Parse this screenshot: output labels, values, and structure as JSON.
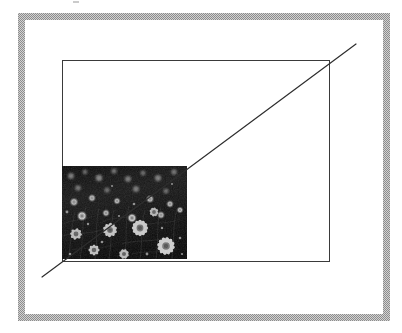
{
  "document": {
    "title": "Proportional image scaling diagram",
    "description": "A bitmap photograph placed at the lower-left of an empty outline rectangle, with a diagonal line drawn from the photo's lower-left corner through its upper-right corner and continuing to the outline rectangle's upper-right corner, illustrating constant aspect-ratio enlargement.",
    "background_color": "#ffffff"
  },
  "mat": {
    "name": "gray halftone border mat",
    "fill_color": "#a9a9a9",
    "dither_light": "#d2d2d2",
    "dither_dark": "#8d8d8d",
    "outer": {
      "x": 18,
      "y": 13,
      "width": 372,
      "height": 308
    },
    "thickness_px": 7,
    "inner_fill": "#ffffff"
  },
  "outline_rect": {
    "name": "target frame outline",
    "stroke_color": "#3a3a3a",
    "stroke_width": 1,
    "fill": "none",
    "x": 62,
    "y": 60,
    "width": 268,
    "height": 202,
    "corners": {
      "top_left": [
        62,
        60
      ],
      "top_right": [
        330,
        60
      ],
      "bottom_right": [
        330,
        262
      ],
      "bottom_left": [
        62,
        262
      ]
    }
  },
  "photo": {
    "name": "daisy field photograph",
    "subject": "black and white photograph of a meadow of daisy / chamomile flowers",
    "rendering": "grayscale halftone bitmap",
    "x": 62,
    "y": 166,
    "width": 125,
    "height": 93,
    "corners": {
      "top_left": [
        62,
        166
      ],
      "top_right": [
        187,
        166
      ],
      "bottom_right": [
        187,
        259
      ],
      "bottom_left": [
        62,
        259
      ]
    },
    "background_color": "#101010",
    "highlight_color": "#f2f2f2",
    "midtone_color": "#6e6e6e",
    "aspect_ratio": "125:93"
  },
  "diagonal": {
    "name": "aspect ratio guide line",
    "stroke_color": "#2e2e2e",
    "stroke_width": 1.2,
    "start": [
      42,
      277
    ],
    "end": [
      356,
      44
    ],
    "passes_through": [
      {
        "label": "photo bottom-left corner",
        "point": [
          62,
          259
        ]
      },
      {
        "label": "photo top-right corner",
        "point": [
          187,
          166
        ]
      },
      {
        "label": "outline rect top-right corner",
        "point": [
          330,
          60
        ]
      }
    ]
  },
  "artifact": {
    "name": "scan speck",
    "x": 73,
    "y": 1,
    "width": 6,
    "height": 2,
    "color": "#b9b9b9"
  }
}
